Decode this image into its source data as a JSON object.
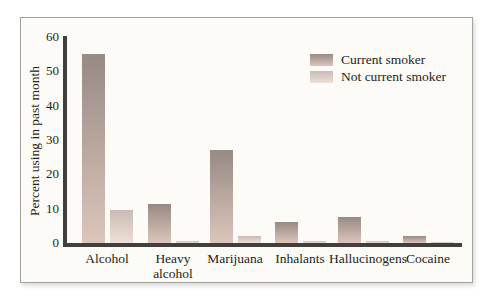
{
  "figure": {
    "background": "#fcfbf7",
    "border_color": "#a3a39c"
  },
  "colors": {
    "bar_current_top": "#978a84",
    "bar_current_bottom": "#dcc5bb",
    "bar_not_top": "#cabcb4",
    "bar_not_bottom": "#ecdfd6",
    "axis": "#42403d",
    "text": "#221f1c"
  },
  "chart_data": {
    "type": "bar",
    "title": "",
    "ylabel": "Percent using in past month",
    "xlabel": "",
    "categories": [
      "Alcohol",
      "Heavy alcohol",
      "Marijuana",
      "Inhalants",
      "Hallucinogens",
      "Cocaine"
    ],
    "series": [
      {
        "name": "Current smoker",
        "values": [
          55,
          11.5,
          27,
          6,
          7.5,
          2
        ]
      },
      {
        "name": "Not current smoker",
        "values": [
          9.5,
          0.7,
          2,
          0.5,
          0.7,
          0.2
        ]
      }
    ],
    "ylim": [
      0,
      60
    ],
    "yticks": [
      0,
      10,
      20,
      30,
      40,
      50,
      60
    ],
    "legend_position": "top-right",
    "grid": false
  }
}
